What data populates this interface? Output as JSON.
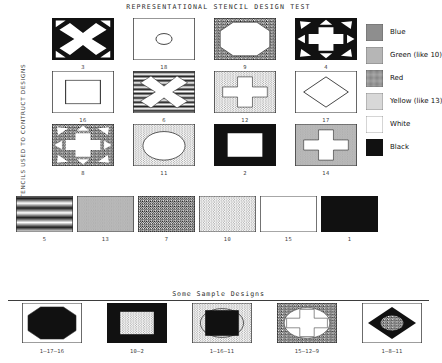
{
  "titles": {
    "main": "REPRESENTATIONAL STENCIL DESIGN TEST",
    "sub": "Some Sample Designs",
    "vertical_axis": "STENCILS USED TO CONTRUCT DESIGNS"
  },
  "legend": {
    "items": [
      {
        "label": "Blue",
        "fill": "blue-hlines",
        "swatch_name": "legend-swatch-blue"
      },
      {
        "label": "Green (like 10)",
        "fill": "green-gray",
        "swatch_name": "legend-swatch-green"
      },
      {
        "label": "Red",
        "fill": "red-noise",
        "swatch_name": "legend-swatch-red"
      },
      {
        "label": "Yellow (like 13)",
        "fill": "yellow-stipple",
        "swatch_name": "legend-swatch-yellow"
      },
      {
        "label": "White",
        "fill": "white",
        "swatch_name": "legend-swatch-white"
      },
      {
        "label": "Black",
        "fill": "black",
        "swatch_name": "legend-swatch-black"
      }
    ]
  },
  "stencils": {
    "rows": [
      [
        {
          "number": "3",
          "fill": "black",
          "shape": "x-corners",
          "shape_color": "white"
        },
        {
          "number": "18",
          "fill": "white",
          "shape": "circle-line",
          "shape_color": "none"
        },
        {
          "number": "9",
          "fill": "red-noise",
          "shape": "octagon",
          "shape_color": "white"
        },
        {
          "number": "4",
          "fill": "black",
          "shape": "cross-arrows",
          "shape_color": "white"
        }
      ],
      [
        {
          "number": "16",
          "fill": "white",
          "shape": "square-line",
          "shape_color": "none"
        },
        {
          "number": "6",
          "fill": "blue-hlines",
          "shape": "x-big",
          "shape_color": "white"
        },
        {
          "number": "12",
          "fill": "yellow-stipple",
          "shape": "cross",
          "shape_color": "white"
        },
        {
          "number": "17",
          "fill": "white",
          "shape": "diamond-line",
          "shape_color": "none"
        }
      ],
      [
        {
          "number": "8",
          "fill": "red-noise",
          "shape": "cross-arrows",
          "shape_color": "white"
        },
        {
          "number": "11",
          "fill": "yellow-stipple",
          "shape": "circle-big",
          "shape_color": "white"
        },
        {
          "number": "2",
          "fill": "black",
          "shape": "square-hole",
          "shape_color": "white"
        },
        {
          "number": "14",
          "fill": "green-gray",
          "shape": "cross",
          "shape_color": "white"
        }
      ],
      [
        {
          "number": "5",
          "fill": "blue-hlines",
          "shape": "plain",
          "shape_color": "none"
        },
        {
          "number": "13",
          "fill": "green-gray",
          "shape": "plain",
          "shape_color": "none"
        },
        {
          "number": "7",
          "fill": "red-noise",
          "shape": "plain",
          "shape_color": "none"
        },
        {
          "number": "10",
          "fill": "yellow-stipple",
          "shape": "plain",
          "shape_color": "none"
        },
        {
          "number": "15",
          "fill": "white",
          "shape": "plain",
          "shape_color": "none"
        },
        {
          "number": "1",
          "fill": "black",
          "shape": "plain",
          "shape_color": "none"
        }
      ]
    ]
  },
  "samples": {
    "items": [
      {
        "label": "1–17–16",
        "base": "white",
        "shape": "octagon",
        "shape_fill": "black"
      },
      {
        "label": "10–2",
        "base": "black",
        "shape": "square-hole",
        "shape_fill": "yellow-stipple"
      },
      {
        "label": "1–16–11",
        "base": "yellow-stipple",
        "shape": "circle-square",
        "shape_fill": "black"
      },
      {
        "label": "15–12–9",
        "base": "red-noise",
        "shape": "cross-circle",
        "shape_fill": "white"
      },
      {
        "label": "1–8–11",
        "base": "white",
        "shape": "diamond-mix",
        "shape_fill": "black"
      }
    ]
  }
}
